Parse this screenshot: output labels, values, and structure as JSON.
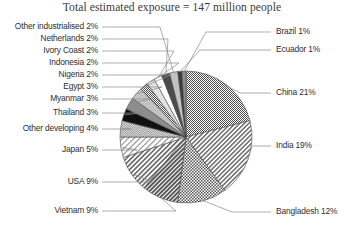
{
  "chart_data": {
    "type": "pie",
    "title": "Total estimated exposure = 147 million people",
    "xlabel": "",
    "ylabel": "",
    "units": "percent of total exposure",
    "total_label": "147 million people",
    "legend_position": "callout-labels",
    "grid": false,
    "categories": [
      "China",
      "India",
      "Bangladesh",
      "Vietnam",
      "USA",
      "Japan",
      "Other developing",
      "Thailand",
      "Myanmar",
      "Egypt",
      "Nigeria",
      "Indonesia",
      "Ivory Coast",
      "Netherlands",
      "Other industrialised",
      "Ecuador",
      "Brazil"
    ],
    "values": [
      21,
      19,
      12,
      9,
      9,
      5,
      4,
      3,
      3,
      3,
      2,
      2,
      2,
      2,
      2,
      1,
      1
    ],
    "labels": [
      "China 21%",
      "India 19%",
      "Bangladesh 12%",
      "Vietnam 9%",
      "USA 9%",
      "Japan 5%",
      "Other developing 4%",
      "Thailand 3%",
      "Myanmar 3%",
      "Egypt 3%",
      "Nigeria 2%",
      "Indonesia 2%",
      "Ivory Coast 2%",
      "Netherlands 2%",
      "Other industrialised 2%",
      "Ecuador 1%",
      "Brazil 1%"
    ],
    "slices": [
      {
        "name": "China",
        "label": "China 21%",
        "value": 21,
        "pattern": "fine-checker",
        "side": "right"
      },
      {
        "name": "India",
        "label": "India 19%",
        "value": 19,
        "pattern": "diagonal-hatch-light",
        "side": "right"
      },
      {
        "name": "Bangladesh",
        "label": "Bangladesh 12%",
        "value": 12,
        "pattern": "coarse-checker",
        "side": "right"
      },
      {
        "name": "Vietnam",
        "label": "Vietnam 9%",
        "value": 9,
        "pattern": "diagonal-hatch-dark",
        "side": "left"
      },
      {
        "name": "USA",
        "label": "USA 9%",
        "value": 9,
        "pattern": "diagonal-hatch-medium",
        "side": "left"
      },
      {
        "name": "Japan",
        "label": "Japan 5%",
        "value": 5,
        "pattern": "diagonal-hatch-sparse",
        "side": "left"
      },
      {
        "name": "Other developing",
        "label": "Other developing 4%",
        "value": 4,
        "pattern": "medium-checker",
        "side": "left"
      },
      {
        "name": "Thailand",
        "label": "Thailand 3%",
        "value": 3,
        "pattern": "solid-black",
        "side": "left"
      },
      {
        "name": "Myanmar",
        "label": "Myanmar 3%",
        "value": 3,
        "pattern": "solid-grey-mid",
        "side": "left"
      },
      {
        "name": "Egypt",
        "label": "Egypt 3%",
        "value": 3,
        "pattern": "solid-grey-light",
        "side": "left"
      },
      {
        "name": "Nigeria",
        "label": "Nigeria 2%",
        "value": 2,
        "pattern": "fine-checker",
        "side": "left"
      },
      {
        "name": "Indonesia",
        "label": "Indonesia 2%",
        "value": 2,
        "pattern": "solid-grey-pale",
        "side": "left"
      },
      {
        "name": "Ivory Coast",
        "label": "Ivory Coast 2%",
        "value": 2,
        "pattern": "solid-white",
        "side": "left"
      },
      {
        "name": "Netherlands",
        "label": "Netherlands 2%",
        "value": 2,
        "pattern": "solid-grey-dark",
        "side": "left"
      },
      {
        "name": "Other industrialised",
        "label": "Other industrialised 2%",
        "value": 2,
        "pattern": "solid-grey-light",
        "side": "left"
      },
      {
        "name": "Ecuador",
        "label": "Ecuador 1%",
        "value": 1,
        "pattern": "solid-grey-darker",
        "side": "right"
      },
      {
        "name": "Brazil",
        "label": "Brazil 1%",
        "value": 1,
        "pattern": "solid-grey-mid",
        "side": "right"
      }
    ],
    "colors": {
      "outline": "#4a4a4a",
      "leader_line": "#8a8a8a",
      "text": "#2e2e2e",
      "title_text": "#3a3a3a",
      "background": "#ffffff"
    }
  }
}
